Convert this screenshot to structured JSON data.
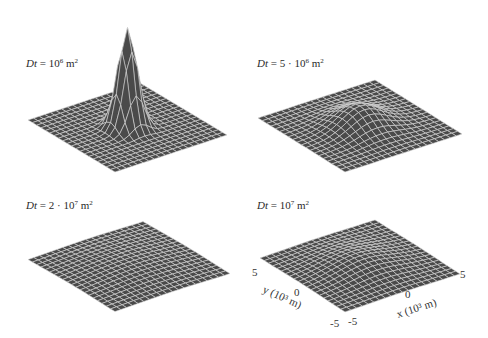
{
  "figure": {
    "panels": [
      {
        "id": "p1",
        "label_var": "Dt",
        "label_eq": " = ",
        "label_coef": "",
        "label_base": "10",
        "label_exp": "6",
        "label_unit": " m",
        "label_unit_exp": "2"
      },
      {
        "id": "p2",
        "label_var": "Dt",
        "label_eq": " = ",
        "label_coef": "5 · ",
        "label_base": "10",
        "label_exp": "6",
        "label_unit": " m",
        "label_unit_exp": "2"
      },
      {
        "id": "p3",
        "label_var": "Dt",
        "label_eq": " = ",
        "label_coef": "2 · ",
        "label_base": "10",
        "label_exp": "7",
        "label_unit": " m",
        "label_unit_exp": "2"
      },
      {
        "id": "p4",
        "label_var": "Dt",
        "label_eq": " = ",
        "label_coef": "",
        "label_base": "10",
        "label_exp": "7",
        "label_unit": " m",
        "label_unit_exp": "2"
      }
    ],
    "axes": {
      "x_title": "x (10³ m)",
      "y_title": "y (10³ m)",
      "x_ticks": [
        "-5",
        "0",
        "5"
      ],
      "y_ticks": [
        "-5",
        "0",
        "5"
      ]
    }
  },
  "chart_data": [
    {
      "type": "surface",
      "title": "Dt = 10^6 m^2",
      "Dt": 1000000,
      "xlabel": "x (10^3 m)",
      "ylabel": "y (10^3 m)",
      "zlabel": "",
      "xlim": [
        -5,
        5
      ],
      "ylim": [
        -5,
        5
      ],
      "grid_n": 21,
      "function": "gaussian: exp(-(x^2+y^2)/(4Dt)) / (4*pi*Dt)",
      "relative_peak_height": 1.0,
      "surface_color": "#4a4a4a",
      "mesh_color": "#d8d8d8"
    },
    {
      "type": "surface",
      "title": "Dt = 5·10^6 m^2",
      "Dt": 5000000,
      "xlabel": "x (10^3 m)",
      "ylabel": "y (10^3 m)",
      "xlim": [
        -5,
        5
      ],
      "ylim": [
        -5,
        5
      ],
      "grid_n": 21,
      "relative_peak_height": 0.2,
      "surface_color": "#4a4a4a",
      "mesh_color": "#d8d8d8"
    },
    {
      "type": "surface",
      "title": "Dt = 2·10^7 m^2",
      "Dt": 20000000,
      "xlabel": "x (10^3 m)",
      "ylabel": "y (10^3 m)",
      "xlim": [
        -5,
        5
      ],
      "ylim": [
        -5,
        5
      ],
      "grid_n": 21,
      "relative_peak_height": 0.05,
      "surface_color": "#4a4a4a",
      "mesh_color": "#d8d8d8"
    },
    {
      "type": "surface",
      "title": "Dt = 10^7 m^2",
      "Dt": 10000000,
      "xlabel": "x (10^3 m)",
      "ylabel": "y (10^3 m)",
      "xlim": [
        -5,
        5
      ],
      "ylim": [
        -5,
        5
      ],
      "x_ticks": [
        -5,
        0,
        5
      ],
      "y_ticks": [
        -5,
        0,
        5
      ],
      "grid_n": 21,
      "relative_peak_height": 0.1,
      "surface_color": "#4a4a4a",
      "mesh_color": "#d8d8d8"
    }
  ],
  "render": {
    "panels_geom": [
      {
        "left": [
          28,
          120
        ],
        "top": [
          140,
          83
        ],
        "right": [
          228,
          130
        ],
        "bottom": [
          115,
          172
        ],
        "zscale": 100,
        "peak_sigma": 1.0
      },
      {
        "left": [
          258,
          118
        ],
        "top": [
          375,
          80
        ],
        "right": [
          458,
          130
        ],
        "bottom": [
          345,
          172
        ],
        "zscale": 20,
        "peak_sigma": 2.236
      },
      {
        "left": [
          28,
          260
        ],
        "top": [
          143,
          222
        ],
        "right": [
          228,
          270
        ],
        "bottom": [
          115,
          312
        ],
        "zscale": 5,
        "peak_sigma": 4.472
      },
      {
        "left": [
          260,
          258
        ],
        "top": [
          375,
          220
        ],
        "right": [
          458,
          270
        ],
        "bottom": [
          345,
          312
        ],
        "zscale": 10,
        "peak_sigma": 3.162
      }
    ],
    "label_pos": [
      [
        26,
        57
      ],
      [
        257,
        57
      ],
      [
        26,
        199
      ],
      [
        257,
        199
      ]
    ]
  }
}
